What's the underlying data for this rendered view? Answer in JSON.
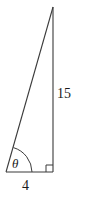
{
  "figure": {
    "type": "right-triangle-diagram",
    "background_color": "#ffffff",
    "stroke_color": "#3a3a3a",
    "text_color": "#1a1a1a",
    "labels": {
      "vertical_side": "15",
      "horizontal_side": "4",
      "angle": "θ"
    },
    "geometry": {
      "apex": [
        53,
        7
      ],
      "bottom_left": [
        6,
        172
      ],
      "bottom_right": [
        53,
        172
      ],
      "arc_radius": 26,
      "right_angle_marker_size": 7
    },
    "icons": {
      "right_angle": "right-angle-marker-icon",
      "angle_arc": "angle-arc-icon"
    }
  }
}
